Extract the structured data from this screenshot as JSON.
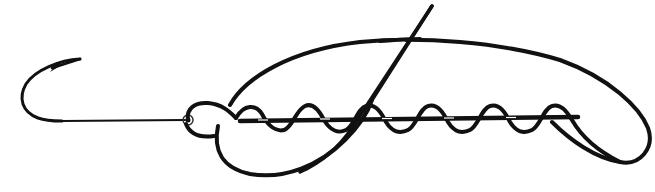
{
  "diagram": {
    "elements": [
      {
        "id": "hook",
        "label": "Fish hook"
      },
      {
        "id": "hook-eye",
        "label": "Hook eye"
      },
      {
        "id": "standing-line",
        "label": "Standing line"
      },
      {
        "id": "wraps",
        "label": "Line wraps (6 turns)"
      },
      {
        "id": "loop",
        "label": "Large loop"
      },
      {
        "id": "tag-end",
        "label": "Tag end"
      }
    ],
    "wrap_count": 6,
    "colors": {
      "stroke": "#111111",
      "background": "#ffffff",
      "hook_shank": "#555555"
    }
  }
}
